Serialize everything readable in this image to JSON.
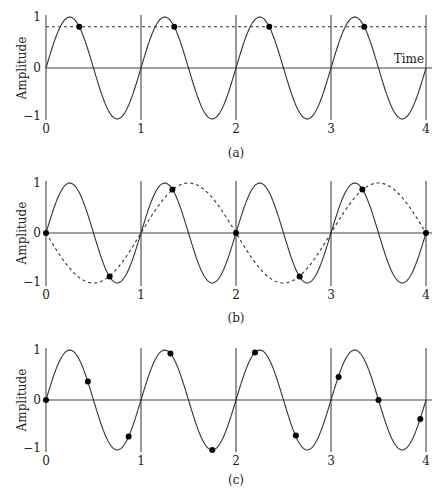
{
  "chart_data": [
    {
      "type": "line",
      "panel_label": "(a)",
      "title": "",
      "xlabel": "Time",
      "ylabel": "Amplitude",
      "x_ticks": [
        "0",
        "1",
        "2",
        "3",
        "4"
      ],
      "y_ticks": [
        "1",
        "0",
        "−1"
      ],
      "xlim": [
        0,
        4
      ],
      "ylim": [
        -1,
        1
      ],
      "series": [
        {
          "name": "signal",
          "style": "solid",
          "function": "sin(2*pi*t)",
          "frequency": 1
        },
        {
          "name": "sampled constant",
          "style": "dashed",
          "function": "0.81",
          "value": 0.81
        }
      ],
      "samples": [
        {
          "t": 0.35,
          "y": 0.81
        },
        {
          "t": 1.35,
          "y": 0.81
        },
        {
          "t": 2.35,
          "y": 0.81
        },
        {
          "t": 3.35,
          "y": 0.81
        }
      ],
      "grid": false
    },
    {
      "type": "line",
      "panel_label": "(b)",
      "xlabel": "",
      "ylabel": "Amplitude",
      "x_ticks": [
        "0",
        "1",
        "2",
        "3",
        "4"
      ],
      "y_ticks": [
        "1",
        "0",
        "−1"
      ],
      "xlim": [
        0,
        4
      ],
      "ylim": [
        -1,
        1
      ],
      "series": [
        {
          "name": "signal",
          "style": "solid",
          "function": "sin(2*pi*t)",
          "frequency": 1
        },
        {
          "name": "alias",
          "style": "dashed",
          "function": "-sin(pi*t)",
          "frequency": 0.5
        }
      ],
      "samples": [
        {
          "t": 0.0,
          "y": 0.0
        },
        {
          "t": 0.67,
          "y": -0.87
        },
        {
          "t": 1.33,
          "y": 0.87
        },
        {
          "t": 2.0,
          "y": 0.0
        },
        {
          "t": 2.67,
          "y": -0.87
        },
        {
          "t": 3.33,
          "y": 0.87
        },
        {
          "t": 4.0,
          "y": 0.0
        }
      ],
      "grid": false
    },
    {
      "type": "line",
      "panel_label": "(c)",
      "xlabel": "",
      "ylabel": "Amplitude",
      "x_ticks": [
        "0",
        "1",
        "2",
        "3",
        "4"
      ],
      "y_ticks": [
        "1",
        "0",
        "−1"
      ],
      "xlim": [
        0,
        4
      ],
      "ylim": [
        -1,
        1
      ],
      "series": [
        {
          "name": "signal",
          "style": "solid",
          "function": "sin(2*pi*t)",
          "frequency": 1
        }
      ],
      "samples": [
        {
          "t": 0.0,
          "y": 0.0
        },
        {
          "t": 0.44,
          "y": 0.37
        },
        {
          "t": 0.87,
          "y": -0.73
        },
        {
          "t": 1.31,
          "y": 0.93
        },
        {
          "t": 1.75,
          "y": -1.0
        },
        {
          "t": 2.2,
          "y": 0.95
        },
        {
          "t": 2.63,
          "y": -0.71
        },
        {
          "t": 3.08,
          "y": 0.46
        },
        {
          "t": 3.5,
          "y": 0.0
        },
        {
          "t": 3.94,
          "y": -0.38
        }
      ],
      "grid": false
    }
  ],
  "panels": [
    {
      "label": "(a)",
      "ylabel": "Amplitude",
      "xlabel": "Time",
      "yticks": [
        "1",
        "0",
        "−1"
      ],
      "xticks": [
        "0",
        "1",
        "2",
        "3",
        "4"
      ]
    },
    {
      "label": "(b)",
      "ylabel": "Amplitude",
      "xlabel": "",
      "yticks": [
        "1",
        "0",
        "−1"
      ],
      "xticks": [
        "0",
        "1",
        "2",
        "3",
        "4"
      ]
    },
    {
      "label": "(c)",
      "ylabel": "Amplitude",
      "xlabel": "",
      "yticks": [
        "1",
        "0",
        "−1"
      ],
      "xticks": [
        "0",
        "1",
        "2",
        "3",
        "4"
      ]
    }
  ]
}
